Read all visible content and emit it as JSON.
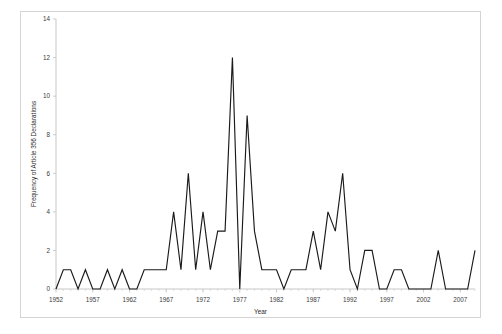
{
  "figure": {
    "background_color": "#ffffff",
    "frame_color": "#d4d4d4",
    "line_color": "#1a1a1a"
  },
  "chart_data": {
    "type": "line",
    "title": "",
    "xlabel": "Year",
    "ylabel": "Frequency of Article 356 Declarations",
    "xlim": [
      1952,
      2009
    ],
    "ylim": [
      0,
      14
    ],
    "ytick_step": 2,
    "yticks": [
      0,
      2,
      4,
      6,
      8,
      10,
      12,
      14
    ],
    "xticks": [
      1952,
      1957,
      1962,
      1967,
      1972,
      1977,
      1982,
      1987,
      1992,
      1997,
      2002,
      2007
    ],
    "xtick_step": 5,
    "minor_xtick_step": 1,
    "grid": false,
    "legend": null,
    "series": [
      {
        "name": "Article 356 Declarations",
        "x": [
          1952,
          1953,
          1954,
          1955,
          1956,
          1957,
          1958,
          1959,
          1960,
          1961,
          1962,
          1963,
          1964,
          1965,
          1966,
          1967,
          1968,
          1969,
          1970,
          1971,
          1972,
          1973,
          1974,
          1975,
          1976,
          1977,
          1978,
          1979,
          1980,
          1981,
          1982,
          1983,
          1984,
          1985,
          1986,
          1987,
          1988,
          1989,
          1990,
          1991,
          1992,
          1993,
          1994,
          1995,
          1996,
          1997,
          1998,
          1999,
          2000,
          2001,
          2002,
          2003,
          2004,
          2005,
          2006,
          2007,
          2008,
          2009
        ],
        "values": [
          0,
          1,
          1,
          0,
          1,
          0,
          0,
          1,
          0,
          1,
          0,
          0,
          1,
          1,
          1,
          1,
          4,
          1,
          6,
          1,
          4,
          1,
          3,
          3,
          12,
          0,
          9,
          3,
          1,
          1,
          1,
          0,
          1,
          1,
          1,
          3,
          1,
          4,
          3,
          6,
          1,
          0,
          2,
          2,
          0,
          0,
          1,
          1,
          0,
          0,
          0,
          0,
          2,
          0,
          0,
          0,
          0,
          2
        ]
      }
    ]
  },
  "axes": {
    "y_tick_labels": [
      "0",
      "2",
      "4",
      "6",
      "8",
      "10",
      "12",
      "14"
    ],
    "x_tick_labels": [
      "1952",
      "1957",
      "1962",
      "1967",
      "1972",
      "1977",
      "1982",
      "1987",
      "1992",
      "1997",
      "2002",
      "2007"
    ],
    "x_axis_title": "Year",
    "y_axis_title": "Frequency of Article 356 Declarations"
  }
}
